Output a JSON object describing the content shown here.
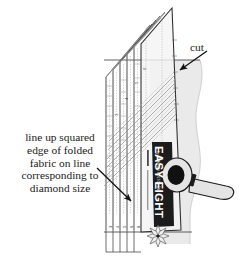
{
  "figure": {
    "background_color": "#ffffff"
  },
  "annotations": {
    "cut_label": "cut",
    "instruction_lines": [
      "line up squared",
      "edge of folded",
      "fabric on line",
      "corresponding to",
      "diamond size"
    ]
  },
  "ruler": {
    "brand_name": "EASY EIGHT",
    "brand_subtitle": "by SHARON HULTGREN",
    "body_color": "#f2f2f2",
    "label_band_color": "#1c1c1c",
    "line_color": "#6b6b6b",
    "edge_color": "#2b2b2b",
    "star_motif": "eight-pointed-star",
    "scale_numbers": [
      "3",
      "4",
      "5",
      "6",
      "8"
    ],
    "diagonal_numbers": [
      "3",
      "4",
      "5",
      "6"
    ]
  },
  "fabric": {
    "label": "folded fabric",
    "fill_color": "#eaeaea",
    "edge_color": "#bdbdbd",
    "fold_line_color": "#555555"
  },
  "rotary_cutter": {
    "label": "rotary cutter",
    "blade_color": "#111111",
    "body_color": "#e4e4e4",
    "outline_color": "#1a1a1a"
  },
  "colors": {
    "ink": "#1a1a1a",
    "arrow": "#111111",
    "paper": "#ffffff"
  }
}
